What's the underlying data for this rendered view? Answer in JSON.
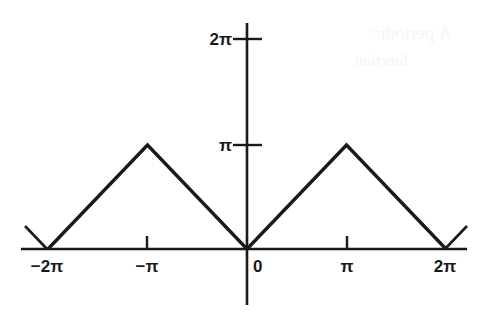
{
  "figure": {
    "background_color": "#ffffff",
    "ink_color": "#1a1a1a",
    "width": 490,
    "height": 313
  },
  "axes": {
    "x_axis_name": "horizontal-axis",
    "y_axis_name": "vertical-axis",
    "origin_label": "0"
  },
  "labels": {
    "x": {
      "neg_two_pi": "−2π",
      "neg_pi": "−π",
      "zero": "0",
      "pi": "π",
      "two_pi": "2π"
    },
    "y": {
      "pi": "π",
      "two_pi": "2π"
    }
  },
  "ghost_text": {
    "line1": "A periodic",
    "line2": "function"
  },
  "chart_data": {
    "type": "line",
    "title": "",
    "subtitle": "",
    "xlabel": "",
    "ylabel": "",
    "grid": false,
    "legend": "none",
    "xlim": [
      -7.33,
      7.54
    ],
    "ylim": [
      -0.92,
      7.4
    ],
    "xticks": [
      -6.2832,
      -3.1416,
      0,
      3.1416,
      6.2832
    ],
    "xticklabels": [
      "−2π",
      "−π",
      "0",
      "π",
      "2π"
    ],
    "yticks": [
      3.1416,
      6.2832
    ],
    "yticklabels": [
      "π",
      "2π"
    ],
    "series": [
      {
        "name": "triangle-wave",
        "description": "y = |x| folded with period 2π, peaks of height π at x = −π and x = π, zeros at x = −2π, 0, 2π",
        "x": [
          -7.0,
          -6.2832,
          -3.1416,
          0,
          3.1416,
          6.2832,
          7.0
        ],
        "y": [
          0.72,
          0,
          3.1416,
          0,
          3.1416,
          0,
          0.72
        ],
        "linewidth": 3,
        "color": "#1a1a1a"
      }
    ],
    "annotations": [
      {
        "name": "peak-left",
        "x": -3.1416,
        "y": 3.1416,
        "text": ""
      },
      {
        "name": "peak-right",
        "x": 3.1416,
        "y": 3.1416,
        "text": ""
      },
      {
        "name": "zero-origin",
        "x": 0,
        "y": 0,
        "text": ""
      }
    ]
  },
  "geometry": {
    "pixel": {
      "x_axis_y": 249,
      "y_axis_x": 247,
      "x_axis_left": 21,
      "x_axis_right": 467,
      "y_axis_top": 23,
      "y_axis_bottom": 305,
      "px_neg2pi": 47,
      "px_negpi": 147,
      "px_zero": 247,
      "px_pi": 347,
      "px_2pi": 445,
      "py_pi": 145,
      "py_2pi": 39,
      "peak_y": 143
    }
  }
}
